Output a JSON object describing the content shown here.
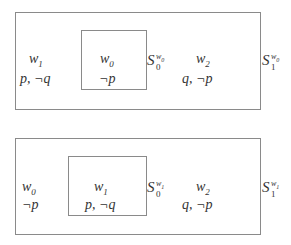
{
  "diagrams": [
    {
      "outer_label": {
        "base": "S",
        "sub": "1",
        "sup_base": "w",
        "sup_sub": "0"
      },
      "inner_label": {
        "base": "S",
        "sub": "0",
        "sup_base": "w",
        "sup_sub": "0"
      },
      "worlds": [
        {
          "name": "w",
          "index": "1",
          "props": "p, ¬q",
          "position": "outside-left"
        },
        {
          "name": "w",
          "index": "0",
          "props": "¬p",
          "position": "inner"
        },
        {
          "name": "w",
          "index": "2",
          "props": "q, ¬p",
          "position": "outside-right"
        }
      ]
    },
    {
      "outer_label": {
        "base": "S",
        "sub": "1",
        "sup_base": "w",
        "sup_sub": "1"
      },
      "inner_label": {
        "base": "S",
        "sub": "0",
        "sup_base": "w",
        "sup_sub": "1"
      },
      "worlds": [
        {
          "name": "w",
          "index": "0",
          "props": "¬p",
          "position": "outside-left"
        },
        {
          "name": "w",
          "index": "1",
          "props": "p, ¬q",
          "position": "inner"
        },
        {
          "name": "w",
          "index": "2",
          "props": "q, ¬p",
          "position": "outside-right"
        }
      ]
    }
  ]
}
